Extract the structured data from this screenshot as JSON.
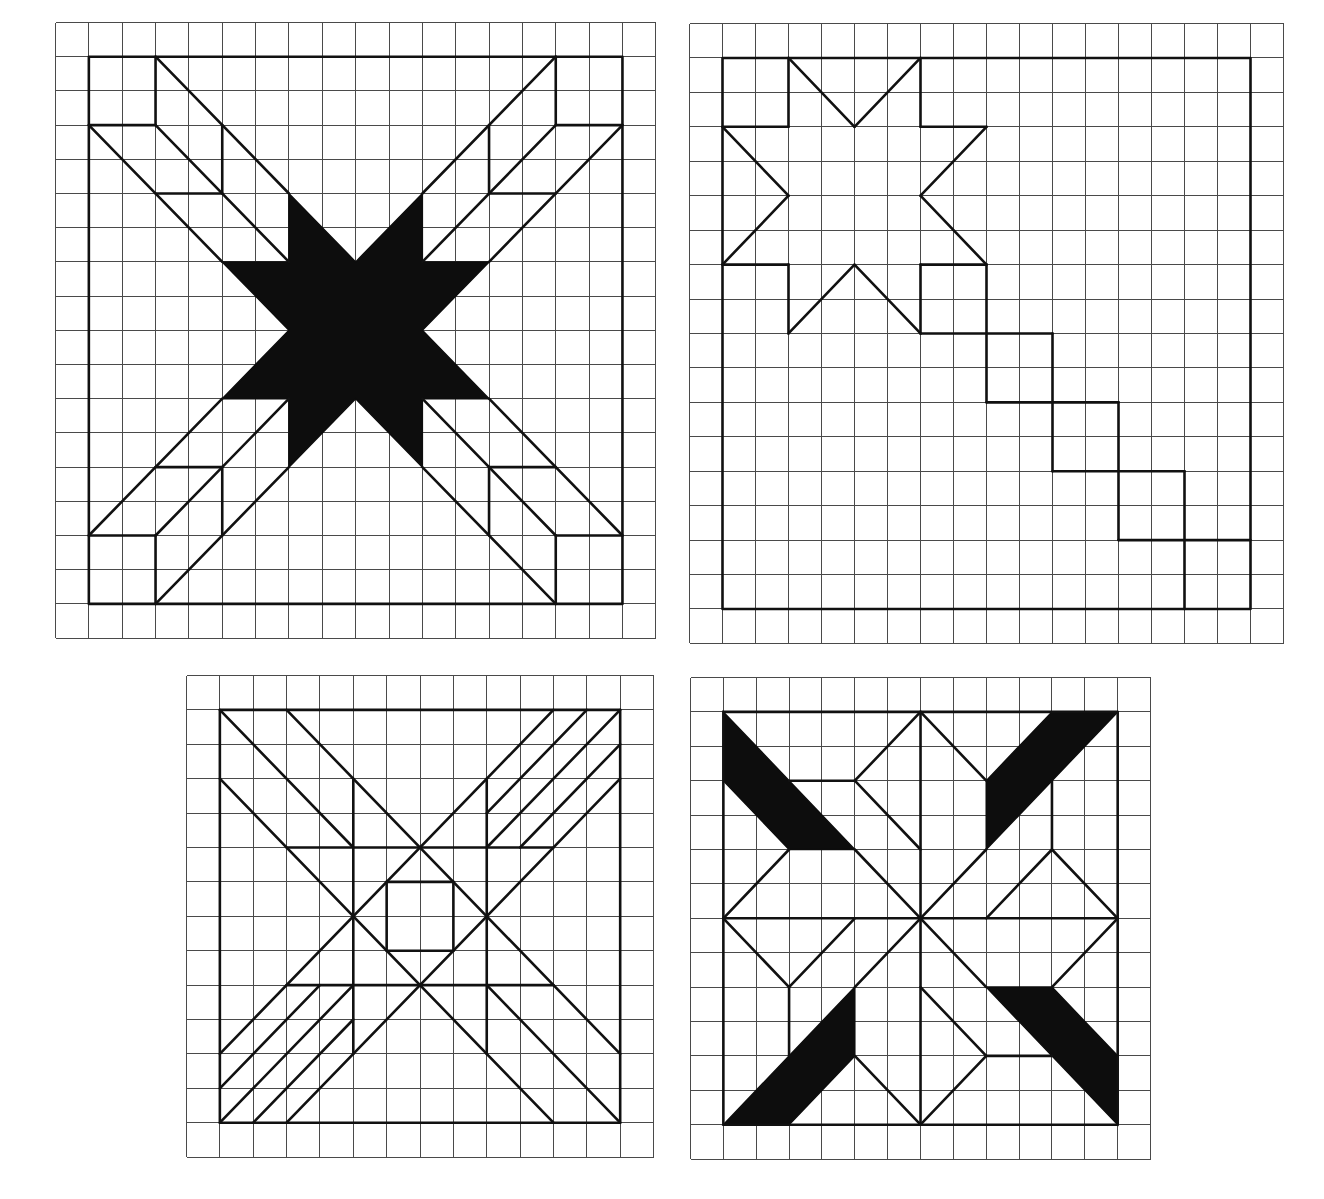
{
  "figure": {
    "colors": {
      "grid": "#4a4a4a",
      "line": "#111111",
      "fill": "#0d0d0d",
      "background": "#ffffff"
    }
  },
  "panels": [
    {
      "id": "star-with-bars",
      "position": {
        "x": 55,
        "y": 22
      },
      "cell": {
        "w": 33.35,
        "h": 34.2
      },
      "grid": {
        "cols": 18,
        "rows": 18
      },
      "border": [
        1,
        1,
        17,
        17
      ],
      "lines": [
        [
          1,
          3,
          3,
          3
        ],
        [
          3,
          1,
          3,
          3
        ],
        [
          3,
          1,
          7,
          5
        ],
        [
          1,
          3,
          5,
          7
        ],
        [
          3,
          3,
          7,
          7
        ],
        [
          5,
          3,
          5,
          5
        ],
        [
          3,
          5,
          5,
          5
        ],
        [
          15,
          1,
          15,
          3
        ],
        [
          15,
          3,
          17,
          3
        ],
        [
          15,
          1,
          11,
          5
        ],
        [
          17,
          3,
          13,
          7
        ],
        [
          15,
          3,
          11,
          7
        ],
        [
          13,
          3,
          13,
          5
        ],
        [
          13,
          5,
          15,
          5
        ],
        [
          1,
          15,
          3,
          15
        ],
        [
          3,
          15,
          3,
          17
        ],
        [
          1,
          15,
          5,
          11
        ],
        [
          3,
          17,
          7,
          13
        ],
        [
          3,
          15,
          7,
          11
        ],
        [
          5,
          13,
          5,
          15
        ],
        [
          3,
          13,
          5,
          13
        ],
        [
          15,
          15,
          17,
          15
        ],
        [
          15,
          15,
          15,
          17
        ],
        [
          17,
          15,
          13,
          11
        ],
        [
          15,
          17,
          11,
          13
        ],
        [
          15,
          15,
          11,
          11
        ],
        [
          13,
          13,
          13,
          15
        ],
        [
          13,
          13,
          15,
          13
        ]
      ],
      "fills": [
        [
          [
            7,
            5
          ],
          [
            7,
            7
          ],
          [
            5,
            7
          ],
          [
            7,
            9
          ],
          [
            5,
            11
          ],
          [
            7,
            11
          ],
          [
            7,
            13
          ],
          [
            9,
            11
          ],
          [
            11,
            13
          ],
          [
            11,
            11
          ],
          [
            13,
            11
          ],
          [
            11,
            9
          ],
          [
            13,
            7
          ],
          [
            11,
            7
          ],
          [
            11,
            5
          ],
          [
            9,
            7
          ]
        ]
      ]
    },
    {
      "id": "star-with-staircase",
      "position": {
        "x": 689,
        "y": 23
      },
      "cell": {
        "w": 33.0,
        "h": 34.44
      },
      "grid": {
        "cols": 18,
        "rows": 18
      },
      "border": [
        1,
        1,
        17,
        17
      ],
      "lines": [
        [
          1,
          3,
          3,
          3
        ],
        [
          3,
          3,
          3,
          1
        ],
        [
          3,
          1,
          5,
          3
        ],
        [
          5,
          3,
          7,
          1
        ],
        [
          7,
          1,
          7,
          3
        ],
        [
          7,
          3,
          9,
          3
        ],
        [
          9,
          3,
          7,
          5
        ],
        [
          7,
          5,
          9,
          7
        ],
        [
          9,
          7,
          7,
          7
        ],
        [
          7,
          7,
          7,
          9
        ],
        [
          7,
          9,
          5,
          7
        ],
        [
          5,
          7,
          3,
          9
        ],
        [
          3,
          9,
          3,
          7
        ],
        [
          3,
          7,
          1,
          7
        ],
        [
          1,
          7,
          3,
          5
        ],
        [
          3,
          5,
          1,
          3
        ],
        [
          7,
          9,
          11,
          9
        ],
        [
          9,
          7,
          9,
          11
        ],
        [
          9,
          11,
          13,
          11
        ],
        [
          11,
          9,
          11,
          13
        ],
        [
          11,
          13,
          15,
          13
        ],
        [
          13,
          11,
          13,
          15
        ],
        [
          13,
          15,
          17,
          15
        ],
        [
          15,
          13,
          15,
          17
        ]
      ],
      "fills": []
    },
    {
      "id": "x-block-with-stripes",
      "position": {
        "x": 186,
        "y": 675
      },
      "cell": {
        "w": 33.36,
        "h": 34.4
      },
      "grid": {
        "cols": 14,
        "rows": 14
      },
      "border": [
        1,
        1,
        13,
        13
      ],
      "lines": [
        [
          1,
          1,
          5,
          5
        ],
        [
          9,
          9,
          13,
          13
        ],
        [
          3,
          1,
          13,
          11
        ],
        [
          1,
          3,
          11,
          13
        ],
        [
          1,
          11,
          11,
          1
        ],
        [
          3,
          13,
          13,
          3
        ],
        [
          12,
          1,
          9,
          4
        ],
        [
          13,
          1,
          9,
          5
        ],
        [
          13,
          2,
          10,
          5
        ],
        [
          1,
          12,
          4,
          9
        ],
        [
          1,
          13,
          5,
          9
        ],
        [
          2,
          13,
          5,
          10
        ],
        [
          5,
          3,
          5,
          11
        ],
        [
          9,
          3,
          9,
          11
        ],
        [
          3,
          5,
          11,
          5
        ],
        [
          3,
          9,
          11,
          9
        ],
        [
          6,
          6,
          8,
          6
        ],
        [
          8,
          6,
          8,
          8
        ],
        [
          8,
          8,
          6,
          8
        ],
        [
          6,
          8,
          6,
          6
        ]
      ],
      "fills": []
    },
    {
      "id": "pinwheel-with-black-bars",
      "position": {
        "x": 690,
        "y": 677
      },
      "cell": {
        "w": 32.86,
        "h": 34.4
      },
      "grid": {
        "cols": 14,
        "rows": 14
      },
      "border": [
        1,
        1,
        13,
        13
      ],
      "lines": [
        [
          7,
          1,
          7,
          13
        ],
        [
          1,
          7,
          13,
          7
        ],
        [
          3,
          3,
          5,
          3
        ],
        [
          5,
          3,
          7,
          1
        ],
        [
          5,
          3,
          7,
          5
        ],
        [
          3,
          5,
          1,
          7
        ],
        [
          5,
          5,
          7,
          7
        ],
        [
          11,
          3,
          11,
          5
        ],
        [
          11,
          5,
          13,
          7
        ],
        [
          11,
          5,
          9,
          7
        ],
        [
          9,
          3,
          7,
          1
        ],
        [
          9,
          5,
          7,
          7
        ],
        [
          9,
          11,
          11,
          11
        ],
        [
          9,
          11,
          7,
          13
        ],
        [
          9,
          11,
          7,
          9
        ],
        [
          11,
          9,
          13,
          7
        ],
        [
          9,
          9,
          7,
          7
        ],
        [
          3,
          9,
          3,
          11
        ],
        [
          3,
          9,
          1,
          7
        ],
        [
          3,
          9,
          5,
          7
        ],
        [
          5,
          11,
          7,
          13
        ],
        [
          5,
          9,
          7,
          7
        ]
      ],
      "fills": [
        [
          [
            1,
            1
          ],
          [
            5,
            5
          ],
          [
            3,
            5
          ],
          [
            1,
            3
          ]
        ],
        [
          [
            11,
            1
          ],
          [
            13,
            1
          ],
          [
            9,
            5
          ],
          [
            9,
            3
          ]
        ],
        [
          [
            9,
            9
          ],
          [
            11,
            9
          ],
          [
            13,
            11
          ],
          [
            13,
            13
          ]
        ],
        [
          [
            5,
            9
          ],
          [
            5,
            11
          ],
          [
            3,
            13
          ],
          [
            1,
            13
          ]
        ]
      ]
    }
  ]
}
